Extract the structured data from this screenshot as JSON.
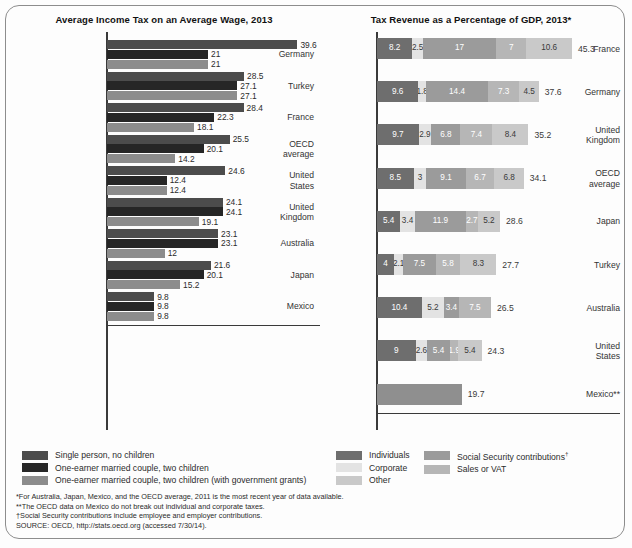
{
  "colors": {
    "single": "#4c4c4c",
    "married": "#262626",
    "married_grant": "#8c8c8c",
    "individuals": "#6e6e6e",
    "corporate": "#e3e3e3",
    "other": "#c9c9c9",
    "social": "#9b9b9b",
    "sales": "#b6b6b6",
    "mexico_bar": "#8f8f8f",
    "axis": "#3a3a3a",
    "text": "#2b2b2b"
  },
  "left_panel": {
    "title": "Average Income Tax on an Average Wage, 2013",
    "legend": [
      {
        "key": "single",
        "label": "Single person, no children"
      },
      {
        "key": "married",
        "label": "One-earner married couple, two children"
      },
      {
        "key": "married_grant",
        "label": "One-earner married couple, two children (with government grants)"
      }
    ]
  },
  "right_panel": {
    "title": "Tax Revenue as a Percentage of GDP, 2013*",
    "legend_col1": [
      {
        "key": "individuals",
        "label": "Individuals"
      },
      {
        "key": "corporate",
        "label": "Corporate"
      },
      {
        "key": "other",
        "label": "Other"
      }
    ],
    "legend_col2": [
      {
        "key": "social",
        "label": "Social Security contributions",
        "dagger": "†"
      },
      {
        "key": "sales",
        "label": "Sales or VAT",
        "dagger": ""
      }
    ]
  },
  "notes": [
    "*For Australia, Japan, Mexico, and the OECD average, 2011 is the most recent year of data available.",
    "**The OECD data on Mexico do not break out individual and corporate taxes.",
    "†Social Security contributions include employee and employer contributions.",
    "SOURCE: OECD, http://stats.oecd.org (accessed 7/30/14)."
  ],
  "chart_data": [
    {
      "type": "bar",
      "id": "income-tax",
      "title": "Average Income Tax on an Average Wage, 2013",
      "orientation": "horizontal",
      "grouped": true,
      "xlabel": "",
      "ylabel": "",
      "xlim": [
        0,
        42
      ],
      "grid": false,
      "legend_position": "below",
      "categories": [
        "Germany",
        "Turkey",
        "France",
        "OECD average",
        "United States",
        "United Kingdom",
        "Australia",
        "Japan",
        "Mexico"
      ],
      "series": [
        {
          "name": "Single person, no children",
          "color_key": "single",
          "values": [
            39.6,
            28.5,
            28.4,
            25.5,
            24.6,
            24.1,
            23.1,
            21.6,
            9.8
          ]
        },
        {
          "name": "One-earner married couple, two children",
          "color_key": "married",
          "values": [
            21,
            27.1,
            22.3,
            20.1,
            12.4,
            24.1,
            23.1,
            20.1,
            9.8
          ]
        },
        {
          "name": "One-earner married couple, two children (with government grants)",
          "color_key": "married_grant",
          "values": [
            21,
            27.1,
            18.1,
            14.2,
            12.4,
            19.1,
            12,
            15.2,
            9.8
          ]
        }
      ]
    },
    {
      "type": "bar",
      "id": "tax-revenue-gdp",
      "title": "Tax Revenue as a Percentage of GDP, 2013*",
      "orientation": "horizontal",
      "stacked": true,
      "xlabel": "",
      "ylabel": "",
      "xlim": [
        0,
        46
      ],
      "grid": false,
      "legend_position": "below",
      "categories": [
        "France",
        "Germany",
        "United Kingdom",
        "OECD average",
        "Japan",
        "Turkey",
        "Australia",
        "United States",
        "Mexico**"
      ],
      "segment_names": [
        "Individuals",
        "Corporate",
        "Social Security contributions",
        "Sales or VAT",
        "Other"
      ],
      "rows": [
        {
          "category": "France",
          "total": 45.3,
          "segments": [
            {
              "key": "individuals",
              "label": "8.2",
              "value": 8.2
            },
            {
              "key": "corporate",
              "label": "2.5",
              "value": 2.5
            },
            {
              "key": "social",
              "label": "17",
              "value": 17
            },
            {
              "key": "sales",
              "label": "7",
              "value": 7
            },
            {
              "key": "other",
              "label": "10.6",
              "value": 10.6
            }
          ]
        },
        {
          "category": "Germany",
          "total": 37.6,
          "segments": [
            {
              "key": "individuals",
              "label": "9.6",
              "value": 9.6
            },
            {
              "key": "corporate",
              "label": "1.8",
              "value": 1.8
            },
            {
              "key": "social",
              "label": "14.4",
              "value": 14.4
            },
            {
              "key": "sales",
              "label": "7.3",
              "value": 7.3
            },
            {
              "key": "other",
              "label": "4.5",
              "value": 4.5
            }
          ]
        },
        {
          "category": "United\nKingdom",
          "total": 35.2,
          "segments": [
            {
              "key": "individuals",
              "label": "9.7",
              "value": 9.7
            },
            {
              "key": "corporate",
              "label": "2.9",
              "value": 2.9
            },
            {
              "key": "social",
              "label": "6.8",
              "value": 6.8
            },
            {
              "key": "sales",
              "label": "7.4",
              "value": 7.4
            },
            {
              "key": "other",
              "label": "8.4",
              "value": 8.4
            }
          ]
        },
        {
          "category": "OECD\naverage",
          "total": 34.1,
          "segments": [
            {
              "key": "individuals",
              "label": "8.5",
              "value": 8.5
            },
            {
              "key": "corporate",
              "label": "3",
              "value": 3
            },
            {
              "key": "social",
              "label": "9.1",
              "value": 9.1
            },
            {
              "key": "sales",
              "label": "6.7",
              "value": 6.7
            },
            {
              "key": "other",
              "label": "6.8",
              "value": 6.8
            }
          ]
        },
        {
          "category": "Japan",
          "total": 28.6,
          "segments": [
            {
              "key": "individuals",
              "label": "5.4",
              "value": 5.4
            },
            {
              "key": "corporate",
              "label": "3.4",
              "value": 3.4
            },
            {
              "key": "social",
              "label": "11.9",
              "value": 11.9
            },
            {
              "key": "sales",
              "label": "2.7",
              "value": 2.7
            },
            {
              "key": "other",
              "label": "5.2",
              "value": 5.2
            }
          ]
        },
        {
          "category": "Turkey",
          "total": 27.7,
          "segments": [
            {
              "key": "individuals",
              "label": "4",
              "value": 4
            },
            {
              "key": "corporate",
              "label": "2.1",
              "value": 2.1
            },
            {
              "key": "social",
              "label": "7.5",
              "value": 7.5
            },
            {
              "key": "sales",
              "label": "5.8",
              "value": 5.8
            },
            {
              "key": "other",
              "label": "8.3",
              "value": 8.3
            }
          ]
        },
        {
          "category": "Australia",
          "total": 26.5,
          "segments": [
            {
              "key": "individuals",
              "label": "10.4",
              "value": 10.4
            },
            {
              "key": "corporate",
              "label": "5.2",
              "value": 5.2
            },
            {
              "key": "social",
              "label": "3.4",
              "value": 3.4
            },
            {
              "key": "sales",
              "label": "7.5",
              "value": 7.5
            }
          ]
        },
        {
          "category": "United\nStates",
          "total": 24.3,
          "segments": [
            {
              "key": "individuals",
              "label": "9",
              "value": 9
            },
            {
              "key": "corporate",
              "label": "2.6",
              "value": 2.6
            },
            {
              "key": "social",
              "label": "5.4",
              "value": 5.4
            },
            {
              "key": "sales",
              "label": "1.9",
              "value": 1.9
            },
            {
              "key": "other",
              "label": "5.4",
              "value": 5.4
            }
          ]
        },
        {
          "category": "Mexico**",
          "total": 19.7,
          "segments": [
            {
              "key": "social",
              "label": "",
              "value": 19.7
            }
          ]
        }
      ]
    }
  ]
}
